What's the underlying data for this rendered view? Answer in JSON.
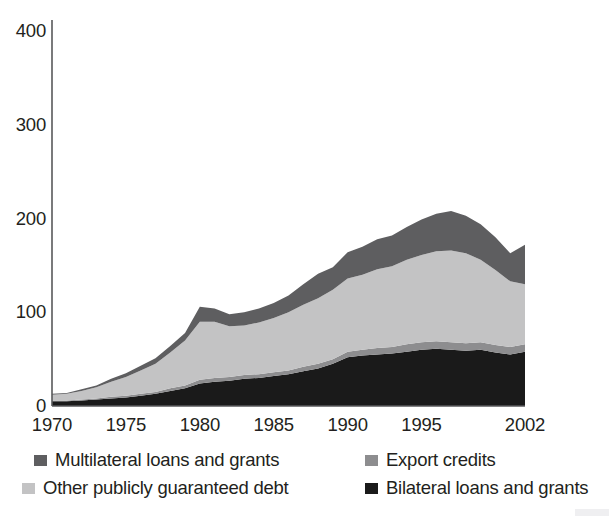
{
  "figure": {
    "clipped_caption": "",
    "background": "#ffffff"
  },
  "axes": {
    "y_ticks": [
      "400",
      "300",
      "200",
      "100",
      "0"
    ],
    "x_ticks": [
      "1970",
      "1975",
      "1980",
      "1985",
      "1990",
      "1995",
      "2002"
    ],
    "axis_color": "#58595b"
  },
  "legend": {
    "items": [
      {
        "label": "Multilateral loans and grants",
        "color": "#5e5e60"
      },
      {
        "label": "Export credits",
        "color": "#8d8d8f"
      },
      {
        "label": "Other publicly guaranteed debt",
        "color": "#c3c3c4"
      },
      {
        "label": "Bilateral loans and grants",
        "color": "#1a1a1a"
      }
    ]
  },
  "chart_data": {
    "type": "area",
    "stacked": true,
    "title": "",
    "xlabel": "",
    "ylabel": "",
    "xlim": [
      1970,
      2002
    ],
    "ylim": [
      0,
      400
    ],
    "y_ticks": [
      0,
      100,
      200,
      300,
      400
    ],
    "x_tick_labels": [
      1970,
      1975,
      1980,
      1985,
      1990,
      1995,
      2002
    ],
    "grid": false,
    "legend_position": "bottom",
    "x": [
      1970,
      1971,
      1972,
      1973,
      1974,
      1975,
      1976,
      1977,
      1978,
      1979,
      1980,
      1981,
      1982,
      1983,
      1984,
      1985,
      1986,
      1987,
      1988,
      1989,
      1990,
      1991,
      1992,
      1993,
      1994,
      1995,
      1996,
      1997,
      1998,
      1999,
      2000,
      2001,
      2002
    ],
    "series": [
      {
        "name": "Bilateral loans and grants",
        "color": "#1a1a1a",
        "values": [
          5,
          5,
          6,
          7,
          8,
          9,
          11,
          13,
          16,
          19,
          24,
          26,
          27,
          29,
          30,
          32,
          34,
          37,
          40,
          45,
          52,
          54,
          55,
          56,
          58,
          60,
          61,
          60,
          59,
          60,
          57,
          55,
          58
        ]
      },
      {
        "name": "Export credits",
        "color": "#8d8d8f",
        "values": [
          1,
          1,
          1,
          1,
          2,
          2,
          2,
          2,
          3,
          3,
          4,
          4,
          4,
          4,
          4,
          4,
          4,
          5,
          5,
          5,
          6,
          6,
          7,
          7,
          8,
          8,
          8,
          8,
          8,
          8,
          8,
          8,
          8
        ]
      },
      {
        "name": "Other publicly guaranteed debt",
        "color": "#c3c3c4",
        "values": [
          6,
          7,
          9,
          12,
          16,
          20,
          25,
          30,
          38,
          48,
          62,
          60,
          54,
          53,
          55,
          58,
          62,
          66,
          70,
          74,
          78,
          80,
          84,
          86,
          90,
          93,
          96,
          98,
          96,
          88,
          80,
          70,
          64
        ]
      },
      {
        "name": "Multilateral loans and grants",
        "color": "#5e5e60",
        "values": [
          1,
          1,
          2,
          2,
          3,
          4,
          5,
          6,
          7,
          8,
          16,
          14,
          13,
          14,
          15,
          16,
          18,
          22,
          26,
          24,
          28,
          30,
          32,
          33,
          35,
          38,
          40,
          42,
          40,
          38,
          35,
          30,
          42
        ]
      }
    ]
  }
}
